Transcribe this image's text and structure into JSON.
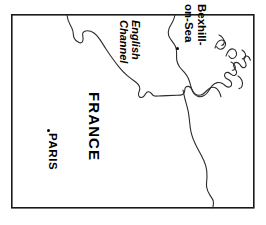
{
  "map": {
    "title": "Map of the English Channel region with France and Bexhill-on-Sea",
    "frame": {
      "x": 11,
      "y": 14,
      "width": 243,
      "height": 194,
      "stroke": "#1a1a1a",
      "stroke_width": 1.6
    },
    "background_color": "#ffffff",
    "coast_stroke": "#2b2b2b",
    "coast_stroke_width": 1.1,
    "labels": [
      {
        "id": "bexhill",
        "text_lines": [
          "Bexhill-",
          "on-Sea"
        ],
        "full_text": "Bexhill-on-Sea",
        "rotation_deg": 90,
        "style": "bold",
        "x": 208,
        "y": 4
      },
      {
        "id": "english-channel",
        "text_lines": [
          "English",
          "Channel"
        ],
        "full_text": "English Channel",
        "rotation_deg": 90,
        "style": "bold-italic",
        "x": 142,
        "y": 20
      },
      {
        "id": "france",
        "text_lines": [
          "FRANCE"
        ],
        "full_text": "FRANCE",
        "rotation_deg": 90,
        "style": "bold",
        "x": 103,
        "y": 92
      },
      {
        "id": "paris",
        "text_lines": [
          "PARIS"
        ],
        "full_text": "PARIS",
        "rotation_deg": 90,
        "style": "bold",
        "x": 59,
        "y": 133
      }
    ],
    "city_markers": [
      {
        "id": "bexhill",
        "name": "Bexhill-on-Sea",
        "x": 177,
        "y": 48
      },
      {
        "id": "paris",
        "name": "PARIS",
        "x": 48,
        "y": 130
      }
    ]
  }
}
